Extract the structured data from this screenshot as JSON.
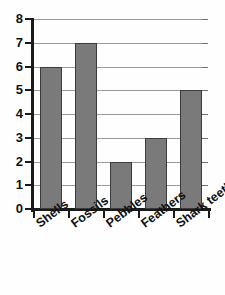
{
  "chart_data": {
    "type": "bar",
    "title": "",
    "subtitle": "",
    "xlabel": "",
    "ylabel": "",
    "categories": [
      "Shells",
      "Fossils",
      "Pebbles",
      "Feathers",
      "Shark teeth"
    ],
    "values": [
      6,
      7,
      2,
      3,
      5
    ],
    "ylim": [
      0,
      8
    ],
    "ytick_labels": [
      "8",
      "7",
      "6",
      "5",
      "4",
      "3",
      "2",
      "1",
      "0"
    ],
    "ytick_values": [
      8,
      7,
      6,
      5,
      4,
      3,
      2,
      1,
      0
    ],
    "grid": true,
    "grid_axis": "y",
    "legend": null,
    "legend_position": "none",
    "annotations": [],
    "bar_color": "#7a7a7a",
    "bar_edge_color": "#3b3b3b",
    "gridline_color": "#9a9a9a",
    "axis_color": "#1a1a1a",
    "background_color": "#fefefe",
    "xtick_label_rotation": -37
  }
}
